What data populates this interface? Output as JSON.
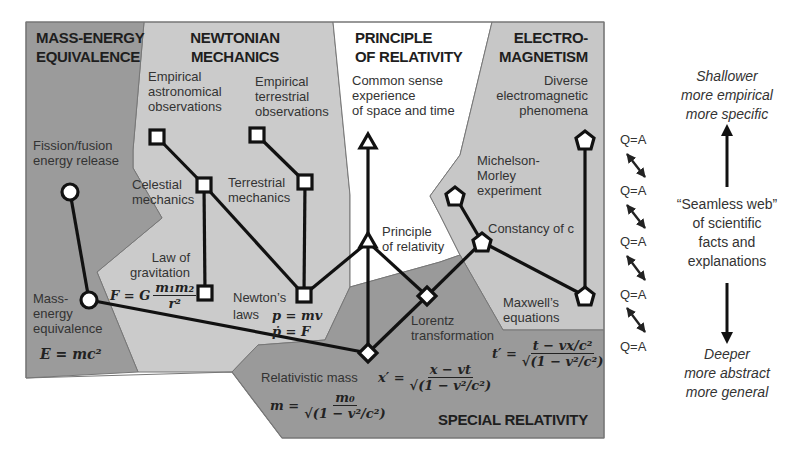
{
  "colors": {
    "mass_energy_region": "#9b9b9b",
    "newtonian_region": "#cbcbcb",
    "principle_region": "#ffffff",
    "electromagnetism_region": "#c7c7c7",
    "special_relativity_region": "#9a9a9a",
    "border": "#707070",
    "edge": "#111111"
  },
  "regions": {
    "mass_energy": {
      "title": [
        "MASS-ENERGY",
        "EQUIVALENCE"
      ]
    },
    "newtonian": {
      "title": [
        "NEWTONIAN",
        "MECHANICS"
      ]
    },
    "principle": {
      "title": [
        "PRINCIPLE",
        "OF RELATIVITY"
      ]
    },
    "electromagnetism": {
      "title": [
        "ELECTRO-",
        "MAGNETISM"
      ]
    },
    "special_relativity": {
      "title": "SPECIAL RELATIVITY"
    }
  },
  "nodes": {
    "fission": {
      "label": [
        "Fission/fusion",
        "energy release"
      ],
      "shape": "circle"
    },
    "mass_energy": {
      "label": [
        "Mass-",
        "energy",
        "equivalence"
      ],
      "shape": "circle",
      "equation": "E = mc²"
    },
    "empirical_astro": {
      "label": [
        "Empirical",
        "astronomical",
        "observations"
      ],
      "shape": "square"
    },
    "empirical_terr": {
      "label": [
        "Empirical",
        "terrestrial",
        "observations"
      ],
      "shape": "square"
    },
    "celestial": {
      "label": [
        "Celestial",
        "mechanics"
      ],
      "shape": "square"
    },
    "terrestrial": {
      "label": [
        "Terrestrial",
        "mechanics"
      ],
      "shape": "square"
    },
    "gravitation": {
      "label": [
        "Law of",
        "gravitation"
      ],
      "shape": "square",
      "equation": {
        "lhs": "F = G",
        "num": "m₁m₂",
        "den": "r²"
      }
    },
    "newtons_laws": {
      "label": [
        "Newton’s",
        "laws"
      ],
      "shape": "square",
      "equation": [
        "p = mv",
        "ṗ = F"
      ]
    },
    "common_sense": {
      "label": [
        "Common sense",
        "experience",
        "of space and time"
      ],
      "shape": "triangle"
    },
    "principle_rel": {
      "label": [
        "Principle",
        "of relativity"
      ],
      "shape": "triangle"
    },
    "diverse_em": {
      "label": [
        "Diverse",
        "electromagnetic",
        "phenomena"
      ],
      "shape": "pentagon"
    },
    "michelson": {
      "label": [
        "Michelson-",
        "Morley",
        "experiment"
      ],
      "shape": "pentagon"
    },
    "constancy_c": {
      "label": "Constancy of c",
      "shape": "pentagon"
    },
    "maxwell": {
      "label": [
        "Maxwell’s",
        "equations"
      ],
      "shape": "pentagon"
    },
    "lorentz": {
      "label": [
        "Lorentz",
        "transformation"
      ],
      "shape": "diamond",
      "eq_x": {
        "lhs": "x′ =",
        "num": "x − vt",
        "den": "√(1 − v²/c²)"
      },
      "eq_t": {
        "lhs": "t′ =",
        "num": "t − vx/c²",
        "den": "√(1 − v²/c²)"
      }
    },
    "rel_mass": {
      "label": "Relativistic mass",
      "shape": "diamond",
      "equation": {
        "lhs": "m =",
        "num": "m₀",
        "den": "√(1 − v²/c²)"
      }
    }
  },
  "qa_labels": [
    "Q=A",
    "Q=A",
    "Q=A",
    "Q=A",
    "Q=A"
  ],
  "side": {
    "top": [
      "Shallower",
      "more empirical",
      "more specific"
    ],
    "middle": [
      "“Seamless web”",
      "of scientific",
      "facts and",
      "explanations"
    ],
    "bottom": [
      "Deeper",
      "more abstract",
      "more general"
    ]
  }
}
